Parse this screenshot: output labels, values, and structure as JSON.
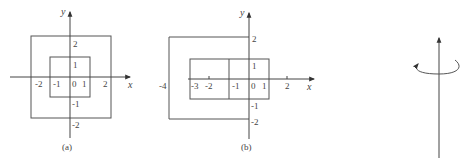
{
  "figures": [
    {
      "id": "a",
      "caption": "(a)",
      "x_axis_label": "x",
      "y_axis_label": "y",
      "x_ticks": [
        "-2",
        "-1",
        "0",
        "1",
        "2"
      ],
      "y_ticks": [
        "2",
        "1",
        "-1",
        "-2"
      ],
      "shapes": [
        {
          "name": "outer-square",
          "x_range": [
            -2,
            2
          ],
          "y_range": [
            -2,
            2
          ]
        },
        {
          "name": "inner-square",
          "x_range": [
            -1,
            1
          ],
          "y_range": [
            -1,
            1
          ]
        }
      ]
    },
    {
      "id": "b",
      "caption": "(b)",
      "x_axis_label": "x",
      "y_axis_label": "y",
      "x_ticks": [
        "-4",
        "-3",
        "-2",
        "-1",
        "0",
        "1",
        "2"
      ],
      "y_ticks": [
        "2",
        "1",
        "-1",
        "-2"
      ],
      "shapes": [
        {
          "name": "outer-open-rectangle",
          "x_range": [
            -4,
            0
          ],
          "y_range": [
            -2,
            2
          ]
        },
        {
          "name": "middle-rectangle",
          "x_range": [
            -3,
            1
          ],
          "y_range": [
            -1,
            1
          ]
        },
        {
          "name": "inner-rectangle",
          "x_range": [
            -1,
            1
          ],
          "y_range": [
            -1,
            1
          ]
        }
      ]
    },
    {
      "id": "c",
      "caption": "",
      "description": "vertical axis with rotation arrow"
    }
  ]
}
